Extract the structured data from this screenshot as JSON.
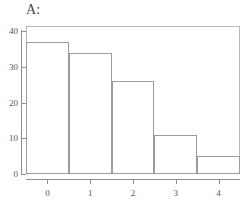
{
  "chart_data": {
    "type": "bar",
    "title": "A:",
    "xlabel": "",
    "ylabel": "",
    "categories": [
      "0",
      "1",
      "2",
      "3",
      "4"
    ],
    "values": [
      37,
      34,
      26,
      11,
      5
    ],
    "xlim": [
      -0.5,
      4.5
    ],
    "ylim": [
      0,
      41.5
    ],
    "yticks": [
      0,
      10,
      20,
      30,
      40
    ],
    "ytick_labels": [
      "0",
      "10",
      "20",
      "30",
      "40"
    ],
    "xticks": [
      0,
      1,
      2,
      3,
      4
    ],
    "xtick_labels": [
      "0",
      "1",
      "2",
      "3",
      "4"
    ],
    "grid": false,
    "legend": null,
    "bar_fill_color": "#ffffff",
    "bar_edge_color": "#9b9b9b",
    "frame_color": "#b9b9b9",
    "axis_color": "#8d8d8d",
    "text_color": "#555555",
    "background_color": "#ffffff",
    "series": [
      {
        "name": "count",
        "values": [
          37,
          34,
          26,
          11,
          5
        ]
      }
    ],
    "bins": [
      {
        "label": "0",
        "left": -0.5,
        "right": 0.5,
        "count": 37
      },
      {
        "label": "1",
        "left": 0.5,
        "right": 1.5,
        "count": 34
      },
      {
        "label": "2",
        "left": 1.5,
        "right": 2.5,
        "count": 26
      },
      {
        "label": "3",
        "left": 2.5,
        "right": 3.5,
        "count": 11
      },
      {
        "label": "4",
        "left": 3.5,
        "right": 4.5,
        "count": 5
      }
    ]
  }
}
